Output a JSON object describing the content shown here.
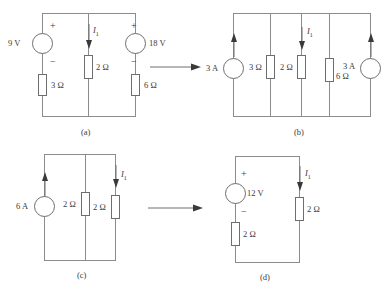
{
  "figure": {
    "type": "circuit-transformation-sequence",
    "panels": [
      {
        "id": "a",
        "caption": "(a)",
        "current_label": "I",
        "current_sub": "1",
        "elements": [
          {
            "kind": "voltage-source",
            "label": "9 V",
            "plus": "+",
            "minus": "−"
          },
          {
            "kind": "resistor",
            "label": "3 Ω"
          },
          {
            "kind": "resistor",
            "label": "2 Ω"
          },
          {
            "kind": "voltage-source",
            "label": "18 V",
            "plus": "+",
            "minus": "−"
          },
          {
            "kind": "resistor",
            "label": "6 Ω"
          }
        ]
      },
      {
        "id": "b",
        "caption": "(b)",
        "current_label": "I",
        "current_sub": "1",
        "elements": [
          {
            "kind": "current-source",
            "label": "3 A"
          },
          {
            "kind": "resistor",
            "label": "3 Ω"
          },
          {
            "kind": "resistor",
            "label": "2 Ω"
          },
          {
            "kind": "resistor",
            "label": "6 Ω"
          },
          {
            "kind": "current-source",
            "label": "3 A"
          }
        ]
      },
      {
        "id": "c",
        "caption": "(c)",
        "current_label": "I",
        "current_sub": "1",
        "elements": [
          {
            "kind": "current-source",
            "label": "6 A"
          },
          {
            "kind": "resistor",
            "label": "2 Ω"
          },
          {
            "kind": "resistor",
            "label": "2 Ω"
          }
        ]
      },
      {
        "id": "d",
        "caption": "(d)",
        "current_label": "I",
        "current_sub": "1",
        "elements": [
          {
            "kind": "voltage-source",
            "label": "12 V",
            "plus": "+",
            "minus": "−"
          },
          {
            "kind": "resistor",
            "label": "2 Ω"
          },
          {
            "kind": "resistor",
            "label": "2 Ω"
          }
        ]
      }
    ],
    "labels": {
      "a": {
        "v9": "9 V",
        "r3": "3 Ω",
        "r2": "2 Ω",
        "v18": "18 V",
        "r6": "6 Ω",
        "plus_left": "+",
        "minus_left": "−",
        "plus_right": "+",
        "minus_right": "−",
        "current": "I",
        "current_sub": "1",
        "caption": "(a)"
      },
      "b": {
        "i3_left": "3 A",
        "r3": "3 Ω",
        "r2": "2 Ω",
        "r6": "6 Ω",
        "i3_right": "3 A",
        "current": "I",
        "current_sub": "1",
        "caption": "(b)"
      },
      "c": {
        "i6": "6 A",
        "r2a": "2 Ω",
        "r2b": "2 Ω",
        "current": "I",
        "current_sub": "1",
        "caption": "(c)"
      },
      "d": {
        "v12": "12 V",
        "plus": "+",
        "minus": "−",
        "r2_series": "2 Ω",
        "r2_branch": "2 Ω",
        "current": "I",
        "current_sub": "1",
        "caption": "(d)"
      }
    },
    "colors": {
      "wire": "#8c8c8c",
      "component_outline": "#6e6e6e",
      "text": "#3a3a3a",
      "background": "#ffffff"
    }
  }
}
